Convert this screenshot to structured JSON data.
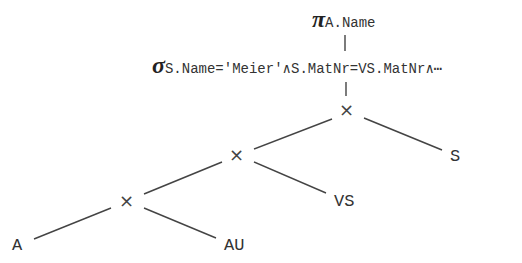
{
  "diagram": {
    "type": "relational-algebra-operator-tree",
    "projection": {
      "symbol": "π",
      "subscript": "A.Name"
    },
    "selection": {
      "symbol": "σ",
      "subscript": "S.Name='Meier'∧S.MatNr=VS.MatNr∧⋯"
    },
    "joins": [
      {
        "symbol": "×",
        "left": "×",
        "right": "S"
      },
      {
        "symbol": "×",
        "left": "×",
        "right": "VS"
      },
      {
        "symbol": "×",
        "left": "A",
        "right": "AU"
      }
    ],
    "leaves": {
      "s": "S",
      "vs": "VS",
      "a": "A",
      "au": "AU"
    }
  }
}
